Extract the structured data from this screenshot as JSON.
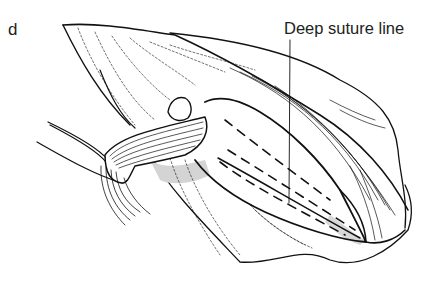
{
  "figure": {
    "panel_letter": "d",
    "annotations": [
      {
        "label": "Deep suture line",
        "target": "dashed suture line on inner surface"
      }
    ],
    "colors": {
      "line": "#111111",
      "shade": "#cfcfcf",
      "background": "#ffffff"
    }
  }
}
